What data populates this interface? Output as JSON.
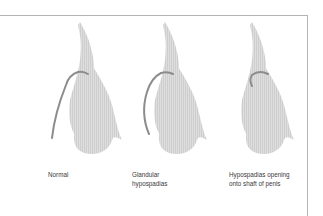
{
  "figure": {
    "panels": [
      {
        "id": "normal",
        "label": "Normal"
      },
      {
        "id": "glandular",
        "label": "Glandular\nhypospadias"
      },
      {
        "id": "shaft",
        "label": "Hypospadias opening\nonto shaft of penis"
      }
    ],
    "colors": {
      "fill": "#dedede",
      "hatch": "#c8c8c8",
      "urethra": "#8c8c8c",
      "frame": "#b4b4b4",
      "text": "#3a3a3a"
    }
  }
}
